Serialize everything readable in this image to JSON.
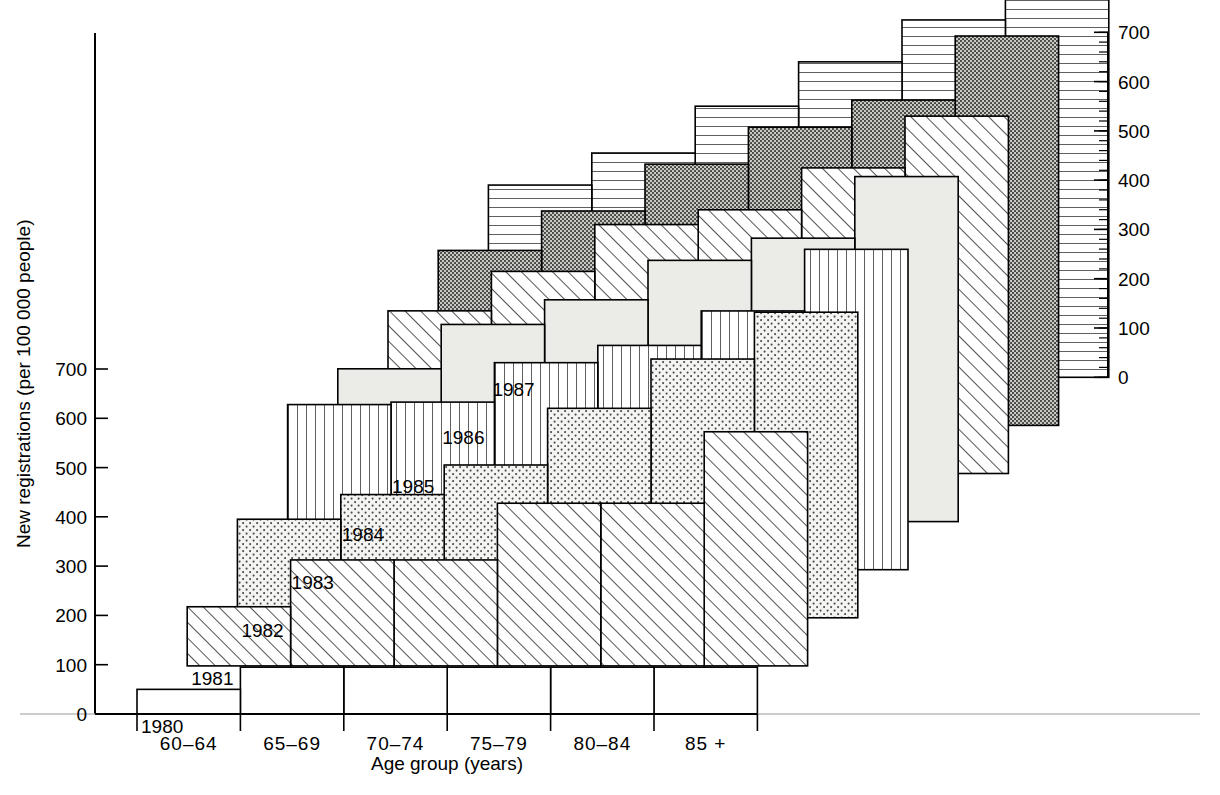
{
  "chart_data": {
    "type": "bar",
    "title": "",
    "xlabel": "Age group (years)",
    "ylabel": "New registrations (per 100 000 people)",
    "categories": [
      "60–64",
      "65–69",
      "70–74",
      "75–79",
      "80–84",
      "85 +"
    ],
    "ylim": [
      0,
      700
    ],
    "yticks": [
      0,
      100,
      200,
      300,
      400,
      500,
      600,
      700
    ],
    "ytick_labels": [
      "0",
      "100",
      "200",
      "300",
      "400",
      "500",
      "600",
      "700"
    ],
    "right_axis": {
      "ticks": [
        0,
        100,
        200,
        300,
        400,
        500,
        600,
        700
      ],
      "tick_labels": [
        "0",
        "100",
        "200",
        "300",
        "400",
        "500",
        "600",
        "700"
      ],
      "minor_tick_step": 20
    },
    "grid": false,
    "legend_position": "inline-right-staircase",
    "style": "3d-staggered-staircase",
    "series": [
      {
        "name": "1980",
        "label": "1980",
        "pattern": "blank",
        "values": [
          50,
          95,
          95,
          95,
          95,
          95
        ]
      },
      {
        "name": "1981",
        "label": "1981",
        "pattern": "diagonal",
        "values": [
          120,
          215,
          215,
          330,
          330,
          475
        ]
      },
      {
        "name": "1982",
        "label": "1982",
        "pattern": "dots-light",
        "values": [
          200,
          250,
          310,
          425,
          525,
          620
        ]
      },
      {
        "name": "1983",
        "label": "1983",
        "pattern": "vertical",
        "values": [
          335,
          340,
          420,
          455,
          525,
          650
        ]
      },
      {
        "name": "1984",
        "label": "1984",
        "pattern": "solid-light",
        "values": [
          310,
          400,
          450,
          530,
          575,
          700
        ]
      },
      {
        "name": "1985",
        "label": "1985",
        "pattern": "diagonal",
        "values": [
          330,
          410,
          505,
          535,
          620,
          725
        ]
      },
      {
        "name": "1986",
        "label": "1986",
        "pattern": "dots-dark",
        "values": [
          355,
          435,
          530,
          605,
          660,
          790
        ]
      },
      {
        "name": "1987",
        "label": "1987",
        "pattern": "horizontal",
        "values": [
          390,
          455,
          550,
          640,
          725,
          880
        ]
      }
    ]
  },
  "axes": {
    "y_left_title": "New registrations (per 100 000 people)",
    "x_title": "Age group (years)"
  }
}
